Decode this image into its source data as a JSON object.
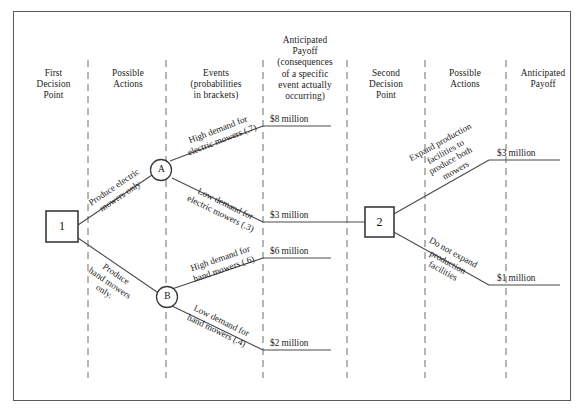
{
  "diagram": {
    "columns": [
      {
        "id": "first-decision-point",
        "label": "First\nDecision\nPoint"
      },
      {
        "id": "possible-actions-1",
        "label": "Possible\nActions"
      },
      {
        "id": "events",
        "label": "Events\n(probabilities\nin brackets)"
      },
      {
        "id": "anticipated-payoff-1",
        "label": "Anticipated\nPayoff\n(consequences\nof a specific\nevent actually\noccurring)"
      },
      {
        "id": "second-decision-point",
        "label": "Second\nDecision\nPoint"
      },
      {
        "id": "possible-actions-2",
        "label": "Possible\nActions"
      },
      {
        "id": "anticipated-payoff-2",
        "label": "Anticipated\nPayoff"
      }
    ],
    "nodes": [
      {
        "id": "decision-node-1",
        "shape": "square",
        "label": "1"
      },
      {
        "id": "chance-node-a",
        "shape": "circle",
        "label": "A"
      },
      {
        "id": "chance-node-b",
        "shape": "circle",
        "label": "B"
      },
      {
        "id": "decision-node-2",
        "shape": "square",
        "label": "2"
      }
    ],
    "actions_first": [
      {
        "id": "produce-electric-mowers-only",
        "label": "Produce electric\nmowers only",
        "from": "decision-node-1",
        "to": "chance-node-a"
      },
      {
        "id": "produce-hand-mowers-only",
        "label": "Produce\nhand mowers\nonly.",
        "from": "decision-node-1",
        "to": "chance-node-b"
      }
    ],
    "events": [
      {
        "id": "high-demand-electric",
        "label": "High demand for\nelectric mowers (.7)",
        "probability": 0.7,
        "payoff": "$8 million"
      },
      {
        "id": "low-demand-electric",
        "label": "Low demand for\nelectric mowers (.3)",
        "probability": 0.3,
        "payoff": "$3 million"
      },
      {
        "id": "high-demand-hand",
        "label": "High demand for\nhand mowers (.6)",
        "probability": 0.6,
        "payoff": "$6 million"
      },
      {
        "id": "low-demand-hand",
        "label": "Low demand for\nhand mowers (.4)",
        "probability": 0.4,
        "payoff": "$2 million"
      }
    ],
    "actions_second": [
      {
        "id": "expand-production",
        "label": "Expand production\nfacilities to\nproduce both\nmowers",
        "payoff": "$3 million"
      },
      {
        "id": "do-not-expand-production",
        "label": "Do not expand\nproduction\nfacilities",
        "payoff": "$1 million"
      }
    ],
    "payoffs": {
      "p1": "$8 million",
      "p2": "$3 million",
      "p3": "$6 million",
      "p4": "$2 million",
      "p5": "$3 million",
      "p6": "$1 million"
    },
    "colors": {
      "frame": "#5c5c5c",
      "line": "#4a4a4a",
      "divider": "#7a7a7a",
      "text": "#1a1a1a",
      "background": "#ffffff"
    }
  }
}
